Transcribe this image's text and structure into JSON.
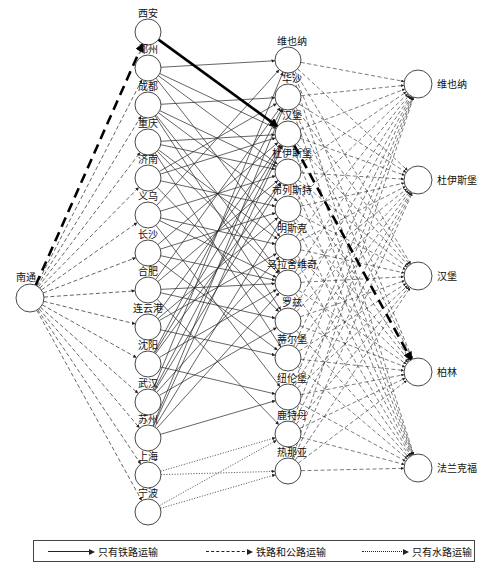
{
  "source_node": {
    "id": "nantong",
    "label": "南通",
    "x": 30,
    "y": 298
  },
  "origin_nodes": [
    {
      "id": "xian",
      "label": "西安",
      "y": 32
    },
    {
      "id": "zhengzhou",
      "label": "郑州",
      "y": 68
    },
    {
      "id": "chengdu",
      "label": "成都",
      "y": 105
    },
    {
      "id": "chongqing",
      "label": "重庆",
      "y": 142
    },
    {
      "id": "jinan",
      "label": "济南",
      "y": 178
    },
    {
      "id": "yiwu",
      "label": "义乌",
      "y": 215
    },
    {
      "id": "changsha",
      "label": "长沙",
      "y": 253
    },
    {
      "id": "hefei",
      "label": "合肥",
      "y": 290
    },
    {
      "id": "lianyungang",
      "label": "连云港",
      "y": 327
    },
    {
      "id": "shenyang",
      "label": "沈阳",
      "y": 364
    },
    {
      "id": "wuhan",
      "label": "武汉",
      "y": 402
    },
    {
      "id": "suzhou",
      "label": "苏州",
      "y": 438
    },
    {
      "id": "shanghai",
      "label": "上海",
      "y": 475
    },
    {
      "id": "ningbo",
      "label": "宁波",
      "y": 512
    }
  ],
  "transit_nodes": [
    {
      "id": "t_vienna",
      "label": "维也纳",
      "y": 60
    },
    {
      "id": "t_warsaw",
      "label": "华沙",
      "y": 97
    },
    {
      "id": "t_hamburg",
      "label": "汉堡",
      "y": 134
    },
    {
      "id": "t_duisburg",
      "label": "杜伊斯堡",
      "y": 172
    },
    {
      "id": "t_brest",
      "label": "布列斯特",
      "y": 209
    },
    {
      "id": "t_minsk",
      "label": "明斯克",
      "y": 247
    },
    {
      "id": "t_malaszewicze",
      "label": "马拉舍维奇",
      "y": 283
    },
    {
      "id": "t_lodz",
      "label": "罗兹",
      "y": 321
    },
    {
      "id": "t_tilburg",
      "label": "蒂尔堡",
      "y": 358
    },
    {
      "id": "t_nuremberg",
      "label": "纽伦堡",
      "y": 397
    },
    {
      "id": "t_rotterdam",
      "label": "鹿特丹",
      "y": 434
    },
    {
      "id": "t_genoa",
      "label": "热那亚",
      "y": 471
    }
  ],
  "destination_nodes": [
    {
      "id": "d_vienna",
      "label": "维也纳",
      "y": 84
    },
    {
      "id": "d_duisburg",
      "label": "杜伊斯堡",
      "y": 180
    },
    {
      "id": "d_hamburg",
      "label": "汉堡",
      "y": 276
    },
    {
      "id": "d_berlin",
      "label": "柏林",
      "y": 372
    },
    {
      "id": "d_frankfurt",
      "label": "法兰克福",
      "y": 468
    }
  ],
  "highlight_path": [
    "nantong",
    "xian",
    "t_hamburg",
    "d_berlin"
  ],
  "legend": {
    "rail_only": "只有铁路运输",
    "rail_and_road": "铁路和公路运输",
    "water_only": "只有水路运输"
  },
  "colors": {
    "line": "#222222",
    "node_stroke": "#333333",
    "node_fill": "#ffffff"
  }
}
